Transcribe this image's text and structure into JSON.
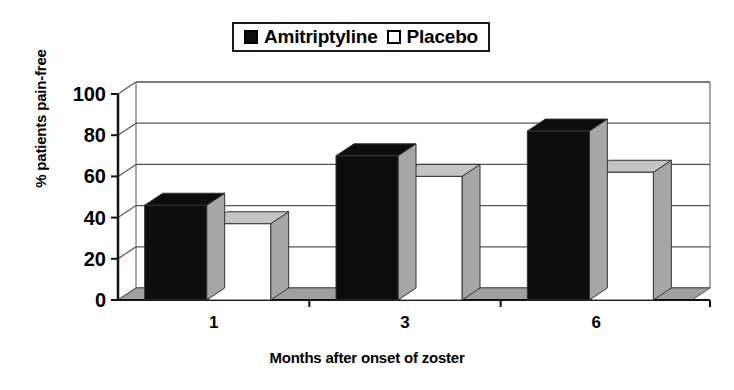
{
  "chart_data": {
    "type": "bar",
    "title": "",
    "xlabel": "Months after onset of zoster",
    "ylabel": "% patients pain-free",
    "categories": [
      "1",
      "3",
      "6"
    ],
    "series": [
      {
        "name": "Amitriptyline",
        "values": [
          46,
          70,
          82
        ],
        "color": "#0d0d0d"
      },
      {
        "name": "Placebo",
        "values": [
          37,
          60,
          62
        ],
        "color": "#ffffff"
      }
    ],
    "ylim": [
      0,
      100
    ],
    "yticks": [
      "0",
      "20",
      "40",
      "60",
      "80",
      "100"
    ],
    "ytick_values": [
      0,
      20,
      40,
      60,
      80,
      100
    ],
    "grid": true,
    "legend_position": "top-center",
    "style": "3d-column"
  },
  "legend": {
    "items": [
      {
        "label": "Amitriptyline",
        "swatch": "filled-square-icon"
      },
      {
        "label": "Placebo",
        "swatch": "hollow-square-icon"
      }
    ]
  },
  "axes": {
    "y_title": "% patients pain-free",
    "x_title": "Months after onset of zoster",
    "y_ticks": [
      "100",
      "80",
      "60",
      "40",
      "20",
      "0"
    ],
    "x_ticks": [
      "1",
      "3",
      "6"
    ]
  },
  "colors": {
    "series_amitriptyline": "#0d0d0d",
    "series_placebo": "#ffffff",
    "bar_side": "#a6a6a6",
    "bar_top": "#c4c4c4",
    "floor": "#a0a0a0",
    "grid": "#555555",
    "axis": "#2b2b2b"
  }
}
